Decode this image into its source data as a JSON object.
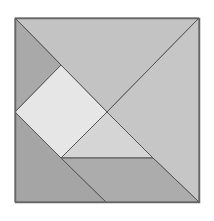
{
  "diagram": {
    "type": "tangram-square",
    "frame": {
      "x": 15,
      "y": 18,
      "width": 184,
      "height": 184,
      "stroke": "#666666"
    },
    "pieces": [
      {
        "name": "large-triangle-top",
        "points": "15,18 199,18 107,112",
        "fill": "#c3c3c3"
      },
      {
        "name": "large-triangle-right",
        "points": "199,18 199,202 153,158 107,112",
        "fill": "#c6c6c6"
      },
      {
        "name": "small-triangle-top-left",
        "points": "15,18 61,65 15,112",
        "fill": "#a9a9a9"
      },
      {
        "name": "square",
        "points": "61,65 107,112 61,158 15,112",
        "fill": "#e6e6e6"
      },
      {
        "name": "medium-triangle-center",
        "points": "107,112 153,158 61,158",
        "fill": "#d5d5d5"
      },
      {
        "name": "large-triangle-bottom-left",
        "points": "15,112 15,202 106,202 61,158",
        "fill": "#a5a5a5"
      },
      {
        "name": "parallelogram-bottom",
        "points": "61,158 153,158 199,202 106,202",
        "fill": "#acacac"
      }
    ]
  }
}
